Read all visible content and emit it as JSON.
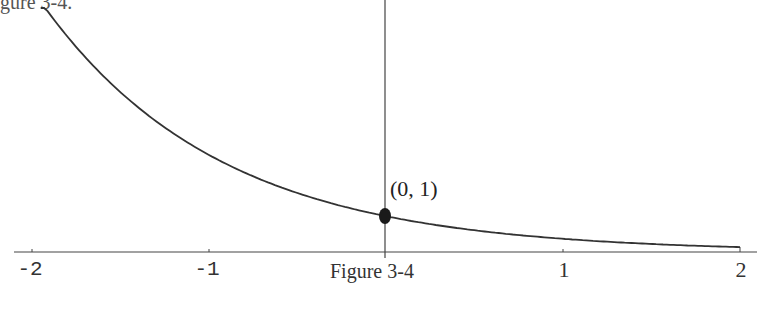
{
  "header": {
    "partial_text": "gure 3-4."
  },
  "caption": "Figure 3-4",
  "point_label": "(0, 1)",
  "x_ticks": [
    {
      "value": -2,
      "label": "-2"
    },
    {
      "value": -1,
      "label": "-1"
    },
    {
      "value": 0,
      "label": ""
    },
    {
      "value": 1,
      "label": "1"
    },
    {
      "value": 2,
      "label": "2"
    }
  ],
  "chart_data": {
    "type": "line",
    "title": "Figure 3-4",
    "function": "y = e^(-x)",
    "xlabel": "",
    "ylabel": "",
    "xlim": [
      -2,
      2
    ],
    "ylim": [
      0,
      7
    ],
    "x_tick_labels": [
      "-2",
      "-1",
      "1",
      "2"
    ],
    "grid": false,
    "legend": null,
    "series": [
      {
        "name": "y = e^(-x)",
        "x": [
          -1.94,
          -1.5,
          -1.0,
          -0.5,
          0.0,
          0.5,
          1.0,
          1.5,
          2.0
        ],
        "values": [
          6.96,
          4.48,
          2.72,
          1.65,
          1.0,
          0.61,
          0.37,
          0.22,
          0.14
        ]
      }
    ],
    "annotations": [
      {
        "type": "point",
        "x": 0,
        "y": 1,
        "label": "(0, 1)"
      }
    ]
  }
}
